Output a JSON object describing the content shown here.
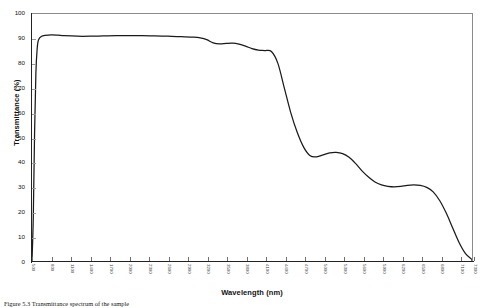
{
  "chart_data": {
    "type": "line",
    "title": "",
    "xlabel": "Wavelength (nm)",
    "ylabel": "Transmittance (%)",
    "xlim": [
      500,
      7300
    ],
    "ylim": [
      0,
      100
    ],
    "grid": false,
    "legend": "none",
    "line_color": "#1a1a1a",
    "x_tick_rotation": 90,
    "xticks": [
      500,
      800,
      1100,
      1400,
      1700,
      2000,
      2300,
      2600,
      2900,
      3200,
      3500,
      3800,
      4100,
      4400,
      4700,
      5000,
      5300,
      5600,
      5900,
      6200,
      6500,
      6800,
      7100,
      7300
    ],
    "yticks": [
      0,
      10,
      20,
      30,
      40,
      50,
      60,
      70,
      80,
      90,
      100
    ],
    "series": [
      {
        "name": "Transmittance",
        "x": [
          500,
          520,
          540,
          560,
          580,
          600,
          650,
          700,
          800,
          900,
          1000,
          1200,
          1400,
          1600,
          1800,
          2000,
          2200,
          2400,
          2600,
          2800,
          3000,
          3100,
          3200,
          3300,
          3400,
          3500,
          3600,
          3700,
          3800,
          3900,
          4000,
          4100,
          4200,
          4300,
          4400,
          4500,
          4600,
          4700,
          4800,
          4900,
          5000,
          5100,
          5200,
          5300,
          5400,
          5500,
          5600,
          5700,
          5800,
          5900,
          6000,
          6100,
          6200,
          6300,
          6400,
          6500,
          6600,
          6700,
          6800,
          6900,
          7000,
          7100,
          7200,
          7300
        ],
        "y": [
          0,
          18,
          52,
          76,
          86,
          89.5,
          91,
          91.3,
          91.5,
          91.4,
          91.2,
          91.0,
          91.0,
          91.1,
          91.2,
          91.2,
          91.2,
          91.1,
          91.0,
          90.8,
          90.6,
          90.3,
          89.6,
          88.3,
          87.9,
          88.1,
          88.2,
          87.8,
          87.0,
          86.0,
          85.4,
          85.2,
          84.8,
          80.0,
          70.0,
          60.0,
          52.0,
          46.0,
          42.6,
          42.2,
          43.0,
          43.8,
          44.0,
          43.5,
          42.0,
          39.5,
          36.5,
          34.0,
          32.0,
          30.8,
          30.2,
          30.0,
          30.2,
          30.6,
          30.8,
          30.6,
          29.8,
          28.0,
          24.5,
          19.5,
          13.5,
          7.5,
          3.0,
          0.6
        ]
      }
    ]
  },
  "axes": {
    "y_title": "Transmittance (%)",
    "x_title": "Wavelength (nm)",
    "y_tick_labels": [
      "100",
      "90",
      "80",
      "70",
      "60",
      "50",
      "40",
      "30",
      "20",
      "10",
      "0"
    ],
    "x_tick_labels": [
      "500",
      "800",
      "1100",
      "1400",
      "1700",
      "2000",
      "2300",
      "2600",
      "2900",
      "3200",
      "3500",
      "3800",
      "4100",
      "4400",
      "4700",
      "5000",
      "5300",
      "5600",
      "5900",
      "6200",
      "6500",
      "6800",
      "7100",
      "7300"
    ]
  },
  "caption": {
    "text": "Figure 5.3  Transmittance spectrum of the sample"
  }
}
